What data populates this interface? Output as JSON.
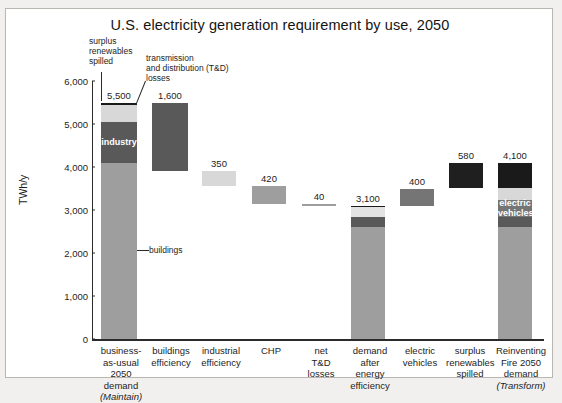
{
  "chart_data": {
    "type": "bar",
    "title": "U.S. electricity generation requirement by use, 2050",
    "xlabel": "",
    "ylabel": "TWh/y",
    "ylim": [
      0,
      6000
    ],
    "yticks": [
      "0",
      "1,000",
      "2,000",
      "3,000",
      "4,000",
      "5,000",
      "6,000"
    ],
    "ytick_values": [
      0,
      1000,
      2000,
      3000,
      4000,
      5000,
      6000
    ],
    "grid": false,
    "legend": "none",
    "waterfall": true,
    "categories": [
      "business-as-usual 2050 demand (Maintain)",
      "buildings efficiency",
      "industrial efficiency",
      "CHP",
      "net T&D losses",
      "demand after energy efficiency",
      "electric vehicles",
      "surplus renewables spilled",
      "Reinventing Fire 2050 demand (Transform)"
    ],
    "values": [
      5500,
      1600,
      350,
      420,
      40,
      3100,
      400,
      580,
      4100
    ],
    "value_labels": [
      "5,500",
      "1,600",
      "350",
      "420",
      "40",
      "3,100",
      "400",
      "580",
      "4,100"
    ],
    "bars": [
      {
        "key": "bau",
        "label_lines": [
          "business-",
          "as-usual",
          "2050",
          "demand",
          "(Maintain)"
        ],
        "italic_last": true,
        "value_label": "5,500",
        "total": 5500,
        "base": 0,
        "stacked": true,
        "segments": [
          {
            "name": "buildings",
            "value": 4100,
            "color": "#9e9e9e",
            "label": ""
          },
          {
            "name": "industry",
            "value": 950,
            "color": "#595959",
            "label": "industry"
          },
          {
            "name": "other",
            "value": 400,
            "color": "#d8d8d8",
            "label": ""
          },
          {
            "name": "surplus renewables spilled",
            "value": 50,
            "color": "#1a1a1a",
            "label": ""
          }
        ]
      },
      {
        "key": "buildings-efficiency",
        "label_lines": [
          "buildings",
          "efficiency"
        ],
        "value_label": "1,600",
        "total": 1600,
        "base": 3900,
        "stacked": false,
        "color": "#595959"
      },
      {
        "key": "industrial-efficiency",
        "label_lines": [
          "industrial",
          "efficiency"
        ],
        "value_label": "350",
        "total": 350,
        "base": 3550,
        "stacked": false,
        "color": "#d8d8d8"
      },
      {
        "key": "chp",
        "label_lines": [
          "CHP"
        ],
        "value_label": "420",
        "total": 420,
        "base": 3130,
        "stacked": false,
        "color": "#9e9e9e"
      },
      {
        "key": "net-td-losses",
        "label_lines": [
          "net",
          "T&D",
          "losses"
        ],
        "value_label": "40",
        "total": 40,
        "base": 3100,
        "stacked": false,
        "color": "#9e9e9e"
      },
      {
        "key": "demand-after-efficiency",
        "label_lines": [
          "demand",
          "after",
          "energy",
          "efficiency"
        ],
        "value_label": "3,100",
        "total": 3100,
        "base": 0,
        "stacked": true,
        "segments": [
          {
            "name": "buildings",
            "value": 2600,
            "color": "#9e9e9e",
            "label": ""
          },
          {
            "name": "industry",
            "value": 230,
            "color": "#595959",
            "label": ""
          },
          {
            "name": "other",
            "value": 230,
            "color": "#e3e3e3",
            "label": ""
          },
          {
            "name": "surplus renewables spilled",
            "value": 40,
            "color": "#1a1a1a",
            "label": ""
          }
        ]
      },
      {
        "key": "electric-vehicles",
        "label_lines": [
          "electric",
          "vehicles"
        ],
        "value_label": "400",
        "total": 400,
        "base": 3100,
        "stacked": false,
        "color": "#757575"
      },
      {
        "key": "surplus-renewables-spilled",
        "label_lines": [
          "surplus",
          "renewables",
          "spilled"
        ],
        "value_label": "580",
        "total": 580,
        "base": 3520,
        "stacked": false,
        "color": "#1f1f1f"
      },
      {
        "key": "reinventing-fire",
        "label_lines": [
          "Reinventing",
          "Fire 2050",
          "demand",
          "(Transform)"
        ],
        "italic_last": true,
        "value_label": "4,100",
        "total": 4100,
        "base": 0,
        "stacked": true,
        "segments": [
          {
            "name": "buildings",
            "value": 2600,
            "color": "#9e9e9e",
            "label": ""
          },
          {
            "name": "industry",
            "value": 230,
            "color": "#595959",
            "label": ""
          },
          {
            "name": "electric vehicles",
            "value": 400,
            "color": "#757575",
            "label": "electric\nvehicles"
          },
          {
            "name": "other",
            "value": 290,
            "color": "#d8d8d8",
            "label": ""
          },
          {
            "name": "surplus renewables spilled",
            "value": 580,
            "color": "#1a1a1a",
            "label": ""
          }
        ]
      }
    ],
    "annotations": [
      {
        "key": "surplus-renewables-spilled-anno",
        "text": "surplus\nrenewables\nspilled"
      },
      {
        "key": "td-losses-anno",
        "text": "transmission\nand distribution (T&D)\nlosses"
      },
      {
        "key": "buildings-anno",
        "text": "buildings"
      }
    ],
    "colors": {
      "buildings": "#9e9e9e",
      "industry": "#595959",
      "electric_vehicles": "#757575",
      "other": "#d8d8d8",
      "spilled": "#1a1a1a",
      "axis": "#2b2b2b",
      "text": "#1d1d1d",
      "frame": "#b9b5b0",
      "page_background": "#f2f0ee"
    }
  }
}
